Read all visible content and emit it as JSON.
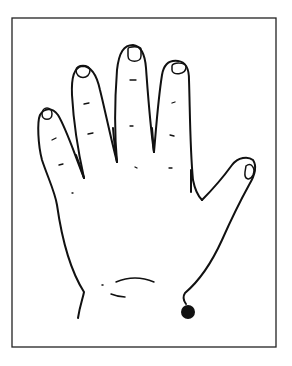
{
  "figure": {
    "frame": {
      "x": 12,
      "y": 18,
      "width": 264,
      "height": 329,
      "stroke": "#222222"
    },
    "marker": {
      "label": "",
      "cx": 188,
      "cy": 312,
      "r": 7,
      "color": "#111111"
    },
    "line_color": "#111111",
    "background": "#ffffff"
  }
}
